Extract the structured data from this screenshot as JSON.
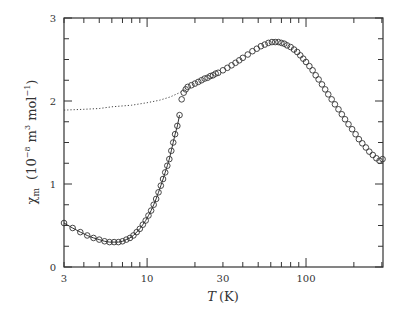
{
  "chart_data": {
    "type": "scatter",
    "title": "",
    "xlabel": "T (K)",
    "xlabel_parts": {
      "var": "T",
      "unit": "(K)"
    },
    "ylabel": "χm (10^-8 m^3 mol^-1)",
    "ylabel_parts": {
      "symbol": "χ",
      "sub": "m",
      "unit_open": "(10",
      "exp1": "−8",
      "unit_mid": " m",
      "exp2": "3",
      "unit_mol": " mol",
      "exp3": "−1",
      "unit_close": ")"
    },
    "xscale": "log",
    "xlim": [
      3,
      305
    ],
    "ylim": [
      0,
      3
    ],
    "xticks": [
      3,
      10,
      30,
      100
    ],
    "xtick_labels": [
      "3",
      "10",
      "30",
      "100"
    ],
    "yticks": [
      0,
      1,
      2,
      3
    ],
    "ytick_labels": [
      "0",
      "1",
      "2",
      "3"
    ],
    "grid": false,
    "legend": null,
    "series": [
      {
        "name": "low-temperature branch",
        "style": "open-circles-with-line",
        "x": [
          3.0,
          3.4,
          3.8,
          4.2,
          4.6,
          5.0,
          5.4,
          5.8,
          6.2,
          6.6,
          7.0,
          7.4,
          7.8,
          8.2,
          8.6,
          9.0,
          9.4,
          9.8,
          10.2,
          10.6,
          11.0,
          11.4,
          11.8,
          12.2,
          12.6,
          13.0,
          13.4,
          13.8,
          14.2,
          14.6,
          15.0,
          15.5,
          16.0
        ],
        "y": [
          0.53,
          0.47,
          0.42,
          0.38,
          0.35,
          0.33,
          0.31,
          0.3,
          0.3,
          0.3,
          0.31,
          0.33,
          0.35,
          0.38,
          0.42,
          0.46,
          0.51,
          0.56,
          0.62,
          0.68,
          0.75,
          0.82,
          0.9,
          0.98,
          1.06,
          1.14,
          1.22,
          1.3,
          1.4,
          1.5,
          1.6,
          1.7,
          1.83
        ]
      },
      {
        "name": "high-temperature branch",
        "style": "open-circles",
        "x": [
          16.5,
          17.0,
          17.5,
          18.0,
          19.0,
          20.0,
          21.0,
          22.0,
          23.0,
          24.0,
          25.0,
          26.0,
          27.0,
          28.0,
          30.0,
          32.0,
          34.0,
          36.0,
          38.0,
          40.0,
          43.0,
          46.0,
          49.0,
          52.0,
          55.0,
          58.0,
          61.0,
          64.0,
          67.0,
          70.0,
          73.0,
          76.0,
          80.0,
          84.0,
          88.0,
          92.0,
          96.0,
          100.0,
          105.0,
          110.0,
          115.0,
          120.0,
          126.0,
          132.0,
          138.0,
          145.0,
          152.0,
          160.0,
          168.0,
          176.0,
          185.0,
          195.0,
          205.0,
          215.0,
          226.0,
          238.0,
          250.0,
          263.0,
          277.0,
          290.0,
          303.0
        ],
        "y": [
          2.02,
          2.1,
          2.14,
          2.17,
          2.19,
          2.21,
          2.23,
          2.25,
          2.27,
          2.28,
          2.3,
          2.31,
          2.33,
          2.34,
          2.37,
          2.4,
          2.43,
          2.46,
          2.49,
          2.52,
          2.56,
          2.6,
          2.63,
          2.66,
          2.68,
          2.7,
          2.71,
          2.71,
          2.71,
          2.7,
          2.69,
          2.67,
          2.65,
          2.62,
          2.59,
          2.55,
          2.51,
          2.47,
          2.42,
          2.37,
          2.31,
          2.26,
          2.2,
          2.14,
          2.08,
          2.02,
          1.96,
          1.9,
          1.84,
          1.78,
          1.72,
          1.66,
          1.6,
          1.54,
          1.49,
          1.44,
          1.39,
          1.35,
          1.31,
          1.28,
          1.3
        ]
      },
      {
        "name": "extrapolated (dotted)",
        "style": "dotted-line",
        "x": [
          3,
          4,
          5,
          6,
          8,
          10,
          12,
          14,
          16,
          17
        ],
        "y": [
          1.89,
          1.9,
          1.91,
          1.93,
          1.95,
          1.98,
          2.01,
          2.05,
          2.1,
          2.13
        ]
      }
    ]
  }
}
